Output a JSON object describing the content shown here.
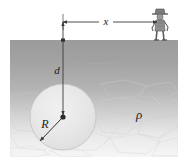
{
  "figure": {
    "labels": {
      "horizontal_distance": "x",
      "depth": "d",
      "radius": "R",
      "density": "ρ"
    },
    "colors": {
      "ground_top": "#9d9d9d",
      "ground_bottom": "#f2f2f2",
      "sphere_fill": "#e9e9e9",
      "sphere_stroke": "#c9c9c9",
      "line": "#5a5a5a",
      "text": "#1a1a1a",
      "rock_stroke": "#d2d2d2",
      "person": "#6e6e6e"
    },
    "geometry": {
      "ground_left": 10,
      "ground_right": 178,
      "ground_surface_y": 40,
      "ground_bottom_y": 157,
      "sphere_center_x": 63,
      "sphere_center_y": 117,
      "sphere_radius": 33,
      "person_x": 160,
      "dimension_line_y": 22
    },
    "elements": {
      "person": "standing-person-figure",
      "sphere": "buried-sphere",
      "ground": "ground-cross-section",
      "rock_texture": "fractured-rock-texture",
      "depth_arrow": "depth-dimension-line",
      "distance_arrow": "horizontal-distance-dimension-line",
      "radius_arrow": "radius-dimension-line"
    }
  }
}
